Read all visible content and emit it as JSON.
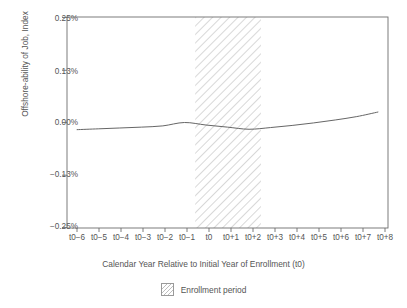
{
  "chart_data": {
    "type": "line",
    "title": "",
    "xlabel": "Calendar Year Relative to Initial Year of Enrollment (t0)",
    "ylabel": "Offshore-ability of Job, Index",
    "categories": [
      "t0−6",
      "t0−5",
      "t0−4",
      "t0−3",
      "t0−2",
      "t0−1",
      "t0",
      "t0+1",
      "t0+2",
      "t0+3",
      "t0+4",
      "t0+5",
      "t0+6",
      "t0+7",
      "t0+8"
    ],
    "x": [
      -6,
      -5,
      -4,
      -3,
      -2,
      -1,
      0,
      1,
      2,
      3,
      4,
      5,
      6,
      7,
      8
    ],
    "series": [
      {
        "name": "Offshore-ability of Job, Index",
        "values": [
          -0.017,
          -0.015,
          -0.013,
          -0.011,
          -0.008,
          0.0,
          -0.006,
          -0.011,
          -0.016,
          -0.012,
          -0.007,
          -0.001,
          0.006,
          0.014,
          0.025
        ],
        "color": "#666666"
      }
    ],
    "ylim": [
      -0.25,
      0.25
    ],
    "yticks": [
      0.25,
      0.13,
      0.0,
      -0.13,
      -0.25
    ],
    "ytick_labels": [
      "0.25%",
      "0.13%",
      "0.00%",
      "−0.13%",
      "−0.25%"
    ],
    "xlim": [
      -6.45,
      8.45
    ],
    "grid": false,
    "legend_position": "bottom-center",
    "annotations": [
      {
        "type": "vspan",
        "label": "Enrollment period",
        "x_start": -0.5,
        "x_end": 2.55,
        "fill": "hatched",
        "color": "#bdbdbd"
      }
    ],
    "legend": [
      {
        "label": "Enrollment period",
        "swatch": "hatched-square"
      }
    ]
  },
  "figure": {
    "axis_color": "#6e6e6e",
    "text_color": "#555555",
    "background": "#ffffff"
  }
}
